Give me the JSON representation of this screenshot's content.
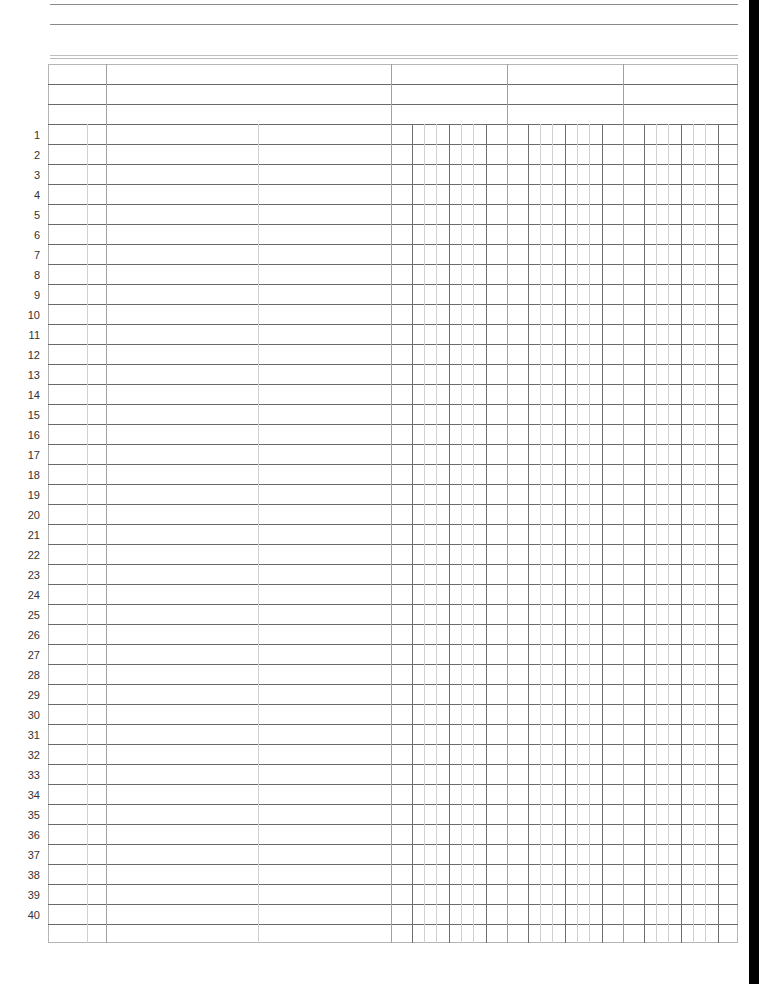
{
  "document": {
    "type": "ledger-sheet",
    "header_lines": 2,
    "header_rows": 3,
    "row_count": 40,
    "row_numbers": [
      "1",
      "2",
      "3",
      "4",
      "5",
      "6",
      "7",
      "8",
      "9",
      "10",
      "11",
      "12",
      "13",
      "14",
      "15",
      "16",
      "17",
      "18",
      "19",
      "20",
      "21",
      "22",
      "23",
      "24",
      "25",
      "26",
      "27",
      "28",
      "29",
      "30",
      "31",
      "32",
      "33",
      "34",
      "35",
      "36",
      "37",
      "38",
      "39",
      "40"
    ],
    "columns": [
      {
        "name": "date-month",
        "label": ""
      },
      {
        "name": "date-day",
        "label": ""
      },
      {
        "name": "description",
        "label": ""
      },
      {
        "name": "reference",
        "label": ""
      },
      {
        "name": "amount-1",
        "label": ""
      },
      {
        "name": "amount-2",
        "label": ""
      },
      {
        "name": "amount-3",
        "label": ""
      }
    ],
    "colors": {
      "grid_dark": "#6e6e6e",
      "grid_light": "#d0d0d0",
      "row_number_text": "#333333",
      "edge_bar": "#000000"
    }
  }
}
